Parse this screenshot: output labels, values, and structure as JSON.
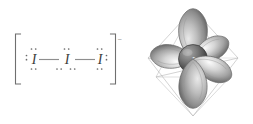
{
  "figure": {
    "background_color": "#ffffff"
  },
  "lewis_structure": {
    "name": "triiodide-lewis-structure",
    "formula": "I3-",
    "bracket_open": "[",
    "bracket_close": "]",
    "charge": "–",
    "charge_sign": "minus",
    "atoms": [
      {
        "id": "atom-left",
        "symbol": "I",
        "lone_pairs": 3,
        "pair_positions": [
          "left",
          "top",
          "bottom"
        ]
      },
      {
        "id": "atom-center",
        "symbol": "I",
        "lone_pairs": 3,
        "pair_positions": [
          "top",
          "bottom-left",
          "bottom-right"
        ]
      },
      {
        "id": "atom-right",
        "symbol": "I",
        "lone_pairs": 3,
        "pair_positions": [
          "right",
          "top",
          "bottom"
        ]
      }
    ],
    "bonds": [
      {
        "id": "bond-left",
        "from": "atom-left",
        "to": "atom-center",
        "order": 1,
        "type": "single"
      },
      {
        "id": "bond-right",
        "from": "atom-center",
        "to": "atom-right",
        "order": 1,
        "type": "single"
      }
    ],
    "colors": {
      "atom_text": "#3b3b3b",
      "bond_line": "#8e8e8e",
      "bracket": "#6f6f6f",
      "dot": "#6b6b6b"
    }
  },
  "orbital_diagram": {
    "name": "trigonal-bipyramidal-orbital-diagram",
    "geometry": "trigonal bipyramidal",
    "central_atom_label": "I",
    "lobe_count": 5,
    "lobes": [
      {
        "id": "lobe-axial-top",
        "direction": "axial-up",
        "angle_deg": -90
      },
      {
        "id": "lobe-axial-bottom",
        "direction": "axial-down",
        "angle_deg": 90
      },
      {
        "id": "lobe-equatorial-left",
        "direction": "equatorial-left",
        "angle_deg": 186
      },
      {
        "id": "lobe-equatorial-upper-right",
        "direction": "equatorial-upper-right",
        "angle_deg": -28
      },
      {
        "id": "lobe-equatorial-lower-right",
        "direction": "equatorial-lower-right",
        "angle_deg": 26
      }
    ],
    "cage": {
      "shape": "trigonal bipyramid wireframe",
      "vertices": 5,
      "visible": true
    },
    "colors": {
      "lobe_light": "#f2f2f2",
      "lobe_mid": "#b9b9b9",
      "lobe_dark": "#6e6e6e",
      "lobe_outline": "#6a6a6a",
      "sphere_light": "#9a9a9a",
      "sphere_dark": "#3a3a3a",
      "cage_line": "#b5b5b5",
      "label_text": "#e8e8e8"
    }
  }
}
